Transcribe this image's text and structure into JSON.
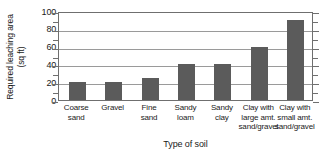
{
  "chart_data": {
    "type": "bar",
    "title": "",
    "xlabel": "Type of soil",
    "ylabel": "Required leaching area (sq ft)",
    "ylabel_lines": [
      "Required leaching area",
      "(sq ft)"
    ],
    "categories": [
      "Coarse sand",
      "Gravel",
      "Fine sand",
      "Sandy loam",
      "Sandy clay",
      "Clay with large amt. sand/gravel",
      "Clay with small amt. sand/gravel"
    ],
    "category_lines": [
      [
        "Coarse",
        "sand"
      ],
      [
        "Gravel"
      ],
      [
        "Fine",
        "sand"
      ],
      [
        "Sandy",
        "loam"
      ],
      [
        "Sandy",
        "clay"
      ],
      [
        "Clay with",
        "large amt.",
        "sand/gravel"
      ],
      [
        "Clay with",
        "small amt.",
        "sand/gravel"
      ]
    ],
    "values": [
      20,
      20,
      25,
      40,
      40,
      60,
      90
    ],
    "ylim": [
      0,
      100
    ],
    "yticks": [
      0,
      20,
      40,
      60,
      80,
      100
    ],
    "ytick_labels": [
      "0",
      "20",
      "40",
      "60",
      "80",
      "100"
    ],
    "yminor_ticks": [
      10,
      30,
      50,
      70,
      90
    ],
    "grid": "horizontal-major",
    "legend": "none",
    "bar_color": "#5b5b5b",
    "frame_color": "#6f6f6f",
    "grid_color": "#9a9a9a",
    "background": "#ffffff"
  }
}
